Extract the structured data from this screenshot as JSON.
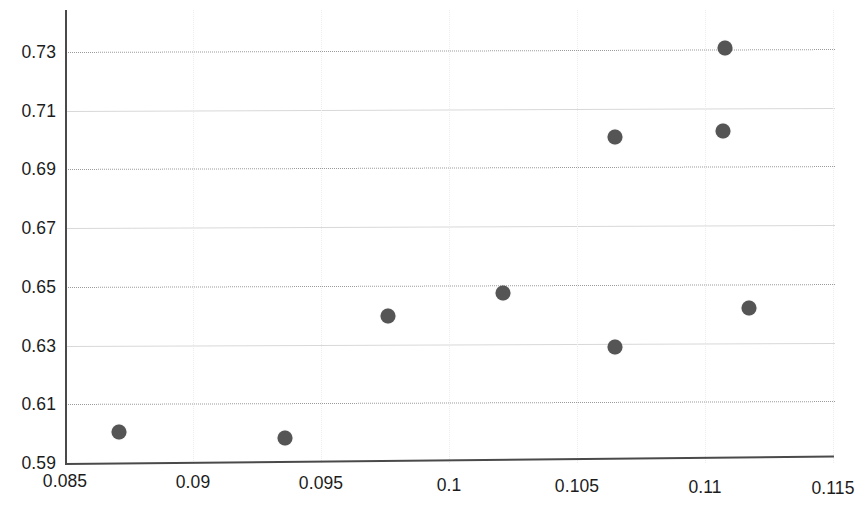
{
  "chart_data": {
    "type": "scatter",
    "title": "",
    "subtitle": "",
    "xlabel": "",
    "ylabel": "",
    "xlim": [
      0.085,
      0.115
    ],
    "ylim": [
      0.59,
      0.73
    ],
    "grid": true,
    "legend": null,
    "x_ticks": [
      "0.085",
      "0.09",
      "0.095",
      "0.1",
      "0.105",
      "0.11",
      "0.115"
    ],
    "x_tick_values": [
      0.085,
      0.09,
      0.095,
      0.1,
      0.105,
      0.11,
      0.115
    ],
    "y_ticks": [
      "0.59",
      "0.61",
      "0.63",
      "0.65",
      "0.67",
      "0.69",
      "0.71",
      "0.73"
    ],
    "y_tick_values": [
      0.59,
      0.61,
      0.63,
      0.65,
      0.67,
      0.69,
      0.71,
      0.73
    ],
    "marker_color": "#555555",
    "gridline_dotted_color": "#9a9a9a",
    "gridline_solid_color": "#d8d8d8",
    "axis_color": "#4a4a4a",
    "series": [
      {
        "name": "series-1",
        "points": [
          {
            "x": 0.0871,
            "y": 0.6006
          },
          {
            "x": 0.0936,
            "y": 0.5985
          },
          {
            "x": 0.0976,
            "y": 0.6401
          },
          {
            "x": 0.1021,
            "y": 0.6479
          },
          {
            "x": 0.1065,
            "y": 0.6295
          },
          {
            "x": 0.1065,
            "y": 0.7009
          },
          {
            "x": 0.1107,
            "y": 0.7031
          },
          {
            "x": 0.1117,
            "y": 0.6428
          },
          {
            "x": 0.1108,
            "y": 0.7313
          }
        ]
      }
    ]
  }
}
